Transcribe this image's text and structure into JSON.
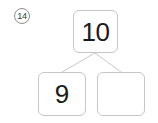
{
  "problem": {
    "number_label": "14",
    "type": "number-bond"
  },
  "number_bond": {
    "whole": {
      "value": "10",
      "filled": true
    },
    "parts": [
      {
        "value": "9",
        "filled": true
      },
      {
        "value": "",
        "filled": false
      }
    ]
  },
  "colors": {
    "box_border": "#c6c6c6",
    "connector_line": "#c9c9c9",
    "circle_border": "#8d8d8d",
    "text": "#1a1a1a",
    "background": "#ffffff"
  }
}
